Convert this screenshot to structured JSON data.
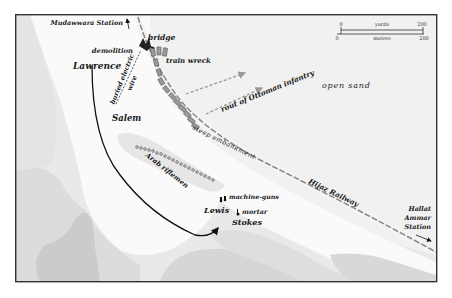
{
  "map": {
    "title": "",
    "labels": {
      "mudawwara_station": "Mudawwara Station",
      "bridge": "bridge",
      "demolition": "demolition",
      "train_wreck": "train wreck",
      "lawrence": "Lawrence",
      "buried_electric": "buried electric",
      "wire": "wire",
      "salem": "Salem",
      "rout_line": "rout of Ottoman infantry",
      "open_sand": "open sand",
      "steep_embankment": "steep embankment",
      "arab_riflemen": "Arab riflemen",
      "machine_guns": "machine-guns",
      "lewis": "Lewis",
      "mortar": "mortar",
      "stokes": "Stokes",
      "hijaz_railway": "Hijaz Railway",
      "hallat": "Hallat",
      "ammar": "Ammar",
      "station": "Station"
    },
    "scale_bar": {
      "yards_start": "0",
      "yards_label": "yards",
      "yards_end": "200",
      "metres_start": "0",
      "metres_label": "metres",
      "metres_end": "200"
    },
    "colors": {
      "border": "#333333",
      "sand_light": "#f4f4f4",
      "terrain_mid": "#e2e2e2",
      "terrain_dark": "#cfcfcf",
      "terrain_darker": "#c4c4c4",
      "railway": "#8a8a8a",
      "train_car": "#9a9a9a",
      "text": "#1a1a1a"
    }
  }
}
